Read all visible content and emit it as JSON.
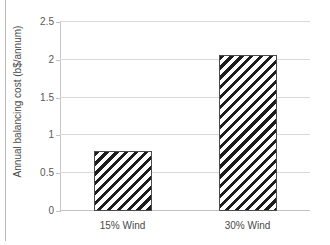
{
  "chart_data": {
    "type": "bar",
    "title": "",
    "subtitle": "",
    "xlabel": "",
    "ylabel": "Annual balancing cost (b$/annum)",
    "categories": [
      "15% Wind",
      "30% Wind"
    ],
    "values": [
      0.79,
      2.06
    ],
    "ylim": [
      0,
      2.5
    ],
    "ytick_values": [
      0,
      0.5,
      1,
      1.5,
      2,
      2.5
    ],
    "ytick_labels": [
      "0",
      "0.5",
      "1",
      "1.5",
      "2",
      "2.5"
    ],
    "grid": "horizontal",
    "legend": "none",
    "series": [
      {
        "name": "Annual balancing cost",
        "values": [
          0.79,
          2.06
        ],
        "fill": "diagonal-hatch",
        "fill_color": "#1d1d1d",
        "edge_color": "#4b4b4b"
      }
    ],
    "annotations": []
  },
  "styling": {
    "background": "#ffffff",
    "gridline_color": "#d9d9d9",
    "axis_color": "#c2c2c2",
    "text_color": "#4a4a4a"
  }
}
